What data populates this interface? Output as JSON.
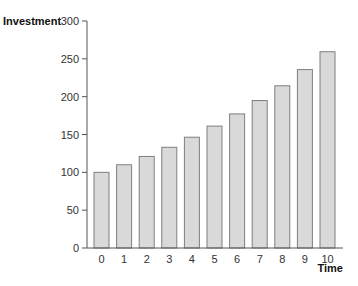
{
  "chart_data": {
    "type": "bar",
    "title": "",
    "xlabel": "Time",
    "ylabel": "Investment",
    "categories": [
      "0",
      "1",
      "2",
      "3",
      "4",
      "5",
      "6",
      "7",
      "8",
      "9",
      "10"
    ],
    "values": [
      100,
      110,
      121,
      133.1,
      146.4,
      161.1,
      177.2,
      194.9,
      214.4,
      235.8,
      259.4
    ],
    "ylim": [
      0,
      300
    ],
    "yticks": [
      0,
      50,
      100,
      150,
      200,
      250,
      300
    ],
    "grid": false,
    "legend": null,
    "colors": {
      "bar_fill": "#d9d9d9",
      "bar_stroke": "#7f7f7f",
      "axis": "#555555"
    }
  }
}
